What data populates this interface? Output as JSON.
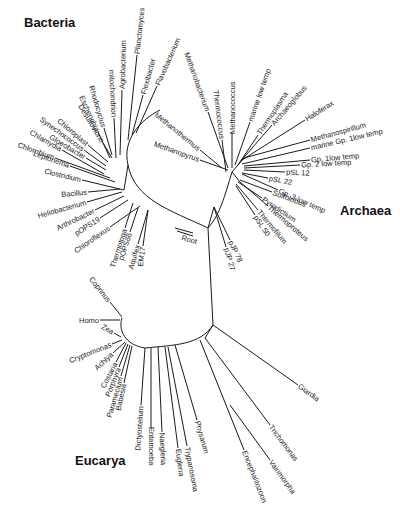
{
  "diagram": {
    "type": "phylogenetic-tree",
    "domains": [
      {
        "id": "bacteria",
        "label": "Bacteria",
        "x": 24,
        "y": 27
      },
      {
        "id": "archaea",
        "label": "Archaea",
        "x": 340,
        "y": 215
      },
      {
        "id": "eucarya",
        "label": "Eucarya",
        "x": 75,
        "y": 465
      }
    ],
    "root_label": {
      "label": "Root",
      "x": 181,
      "y": 240,
      "angle": 15
    },
    "nodes": {
      "root": [
        208,
        228
      ],
      "bacteria_hub": [
        125,
        185
      ],
      "archaea_hub": [
        232,
        172
      ],
      "euk_hub": [
        213,
        325
      ]
    },
    "bacteria_arc": "M 208 228 C 170 210, 135 200, 128 165 C 122 140, 140 120, 160 110",
    "archaea_arc": "M 208 228 C 220 215, 225 195, 232 172",
    "euk_arc": "M 208 228 L 213 325 C 200 345, 175 345, 145 348 C 125 345, 118 330, 122 318",
    "bacteria_leaves": [
      {
        "label": "mitochondrion",
        "from": [
          116,
          158
        ],
        "to": [
          114,
          118
        ],
        "angle": 82
      },
      {
        "label": "Agrobacterium",
        "from": [
          120,
          155
        ],
        "to": [
          122,
          90
        ],
        "angle": -88
      },
      {
        "label": "Planctomyces",
        "from": [
          128,
          140
        ],
        "to": [
          137,
          55
        ],
        "angle": -84
      },
      {
        "label": "Flexibacter",
        "from": [
          132,
          135
        ],
        "to": [
          143,
          95
        ],
        "angle": -76
      },
      {
        "label": "Flavobacterium",
        "from": [
          136,
          133
        ],
        "to": [
          157,
          86
        ],
        "angle": -66
      },
      {
        "label": "Rhodocyclus",
        "from": [
          112,
          155
        ],
        "to": [
          104,
          128
        ],
        "angle": 72
      },
      {
        "label": "Escherichia",
        "from": [
          110,
          158
        ],
        "to": [
          98,
          132
        ],
        "angle": 65
      },
      {
        "label": "Desulfovibrio",
        "from": [
          112,
          158
        ],
        "to": [
          103,
          143
        ],
        "angle": 60
      },
      {
        "label": "Chloroplast",
        "from": [
          108,
          162
        ],
        "to": [
          88,
          145
        ],
        "angle": 52
      },
      {
        "label": "Synechococcus",
        "from": [
          106,
          166
        ],
        "to": [
          84,
          150
        ],
        "angle": 45
      },
      {
        "label": "Gloeobacter",
        "from": [
          106,
          170
        ],
        "to": [
          86,
          158
        ],
        "angle": 32
      },
      {
        "label": "Chlamydia",
        "from": [
          104,
          174
        ],
        "to": [
          62,
          150
        ],
        "angle": 22
      },
      {
        "label": "Chlorobium",
        "from": [
          110,
          178
        ],
        "to": [
          55,
          158
        ],
        "angle": 12
      },
      {
        "label": "Leptonema",
        "from": [
          115,
          182
        ],
        "to": [
          70,
          166
        ],
        "angle": 5
      },
      {
        "label": "Clostridium",
        "from": [
          124,
          190
        ],
        "to": [
          82,
          180
        ],
        "angle": 0
      },
      {
        "label": "Bacillus",
        "from": [
          120,
          189
        ],
        "to": [
          88,
          192
        ],
        "angle": -4
      },
      {
        "label": "Heliobacterium",
        "from": [
          122,
          192
        ],
        "to": [
          87,
          202
        ],
        "angle": -12
      },
      {
        "label": "Arthrobacter",
        "from": [
          124,
          196
        ],
        "to": [
          95,
          210
        ],
        "angle": -22
      },
      {
        "label": "pOPS19",
        "from": [
          128,
          200
        ],
        "to": [
          100,
          218
        ],
        "angle": -32
      },
      {
        "label": "Chloroflexus",
        "from": [
          140,
          206
        ],
        "to": [
          110,
          227
        ],
        "angle": -35
      },
      {
        "label": "Thermotoga",
        "from": [
          133,
          203
        ],
        "to": [
          125,
          228
        ],
        "angle": -55
      },
      {
        "label": "pOPS66",
        "from": [
          138,
          208
        ],
        "to": [
          130,
          232
        ],
        "angle": -62
      },
      {
        "label": "Aquifex",
        "from": [
          148,
          210
        ],
        "to": [
          138,
          244
        ],
        "angle": -70
      },
      {
        "label": "EM17",
        "from": [
          148,
          210
        ],
        "to": [
          143,
          246
        ],
        "angle": -80
      }
    ],
    "archaea_leaves": [
      {
        "label": "Methanobacterium",
        "from": [
          228,
          168
        ],
        "to": [
          208,
          112
        ],
        "angle": 63
      },
      {
        "label": "Thermococcus",
        "from": [
          226,
          172
        ],
        "to": [
          222,
          140
        ],
        "angle": 78
      },
      {
        "label": "Methanococcus",
        "from": [
          232,
          168
        ],
        "to": [
          232,
          133
        ],
        "angle": 90
      },
      {
        "label": "Methanothermus",
        "from": [
          222,
          168
        ],
        "to": [
          200,
          150
        ],
        "angle": 35
      },
      {
        "label": "Methanopyrus",
        "from": [
          228,
          170
        ],
        "to": [
          200,
          160
        ],
        "angle": 20
      },
      {
        "label": "marine low temp",
        "from": [
          235,
          165
        ],
        "to": [
          250,
          122
        ],
        "angle": -72
      },
      {
        "label": "Thermoplasma",
        "from": [
          238,
          165
        ],
        "to": [
          258,
          135
        ],
        "angle": -58
      },
      {
        "label": "Archaeoglobus",
        "from": [
          240,
          162
        ],
        "to": [
          272,
          125
        ],
        "angle": -45
      },
      {
        "label": "Haloferax",
        "from": [
          242,
          160
        ],
        "to": [
          305,
          120
        ],
        "angle": -30
      },
      {
        "label": "Methanospirillum",
        "from": [
          244,
          158
        ],
        "to": [
          310,
          140
        ],
        "angle": -8
      },
      {
        "label": "marine Gp. 1low temp",
        "from": [
          242,
          164
        ],
        "to": [
          310,
          148
        ],
        "angle": 0
      },
      {
        "label": "Gp. 1low temp",
        "from": [
          244,
          166
        ],
        "to": [
          310,
          160
        ],
        "angle": 10
      },
      {
        "label": "Gp. 2 low temp",
        "from": [
          244,
          168
        ],
        "to": [
          300,
          165
        ],
        "angle": 16
      },
      {
        "label": "pSL 12",
        "from": [
          244,
          170
        ],
        "to": [
          285,
          172
        ],
        "angle": 15
      },
      {
        "label": "pSL 22",
        "from": [
          242,
          173
        ],
        "to": [
          268,
          178
        ],
        "angle": 18
      },
      {
        "label": "Gp. 3 low temp",
        "from": [
          242,
          174
        ],
        "to": [
          278,
          190
        ],
        "angle": 22
      },
      {
        "label": "Sulfolobus",
        "from": [
          240,
          180
        ],
        "to": [
          272,
          192
        ],
        "angle": 25
      },
      {
        "label": "Pyrodictium",
        "from": [
          238,
          182
        ],
        "to": [
          262,
          198
        ],
        "angle": 32
      },
      {
        "label": "Thermoproteus",
        "from": [
          240,
          182
        ],
        "to": [
          268,
          206
        ],
        "angle": 40
      },
      {
        "label": "Thermofilum",
        "from": [
          236,
          184
        ],
        "to": [
          258,
          210
        ],
        "angle": 48
      },
      {
        "label": "pSL 50",
        "from": [
          236,
          186
        ],
        "to": [
          255,
          215
        ],
        "angle": 55
      },
      {
        "label": "pJP 78",
        "from": [
          214,
          207
        ],
        "to": [
          230,
          240
        ],
        "angle": 60
      },
      {
        "label": "pJP 27",
        "from": [
          214,
          207
        ],
        "to": [
          226,
          247
        ],
        "angle": 68
      }
    ],
    "eukarya_leaves": [
      {
        "label": "Coprinus",
        "from": [
          122,
          317
        ],
        "to": [
          110,
          302
        ],
        "angle": 60
      },
      {
        "label": "Homo",
        "from": [
          120,
          320
        ],
        "to": [
          100,
          320
        ],
        "angle": 40
      },
      {
        "label": "Zea",
        "from": [
          121,
          337
        ],
        "to": [
          114,
          333
        ],
        "angle": 0
      },
      {
        "label": "Cryptomonas",
        "from": [
          122,
          340
        ],
        "to": [
          112,
          344
        ],
        "angle": 0
      },
      {
        "label": "Achlya",
        "from": [
          125,
          342
        ],
        "to": [
          113,
          353
        ],
        "angle": -20
      },
      {
        "label": "Costaria",
        "from": [
          126,
          343
        ],
        "to": [
          116,
          362
        ],
        "angle": -35
      },
      {
        "label": "Porphyra",
        "from": [
          128,
          344
        ],
        "to": [
          119,
          367
        ],
        "angle": -48
      },
      {
        "label": "Paramecium",
        "from": [
          130,
          345
        ],
        "to": [
          121,
          376
        ],
        "angle": -60
      },
      {
        "label": "Babesia",
        "from": [
          132,
          346
        ],
        "to": [
          124,
          383
        ],
        "angle": -75
      },
      {
        "label": "Dictyostelium",
        "from": [
          145,
          348
        ],
        "to": [
          141,
          405
        ],
        "angle": -88
      },
      {
        "label": "Entamoeba",
        "from": [
          151,
          348
        ],
        "to": [
          151,
          428
        ],
        "angle": -90
      },
      {
        "label": "Naegleria",
        "from": [
          158,
          347
        ],
        "to": [
          162,
          432
        ],
        "angle": 88
      },
      {
        "label": "Euglena",
        "from": [
          165,
          347
        ],
        "to": [
          178,
          448
        ],
        "angle": 86
      },
      {
        "label": "Trypanosoma",
        "from": [
          168,
          347
        ],
        "to": [
          187,
          446
        ],
        "angle": 82
      },
      {
        "label": "Physarum",
        "from": [
          175,
          345
        ],
        "to": [
          197,
          420
        ],
        "angle": 70
      },
      {
        "label": "Encephalitozoon",
        "from": [
          200,
          340
        ],
        "to": [
          244,
          450
        ],
        "angle": 72
      },
      {
        "label": "Vairimorpha",
        "from": [
          230,
          405
        ],
        "to": [
          270,
          460
        ],
        "angle": 58
      },
      {
        "label": "Trichomonas",
        "from": [
          205,
          338
        ],
        "to": [
          270,
          425
        ],
        "angle": 52
      },
      {
        "label": "Giardia",
        "from": [
          213,
          325
        ],
        "to": [
          298,
          385
        ],
        "angle": 35
      }
    ]
  }
}
